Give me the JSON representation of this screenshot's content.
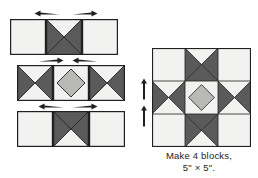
{
  "diagram": {
    "kind": "quilt-block-assembly",
    "block_name": "ohio-star",
    "caption": {
      "line1": "Make 4 blocks,",
      "line2": "5\" × 5\"."
    },
    "colors": {
      "light": "#f2f2f0",
      "medium": "#b9b9b7",
      "dark": "#5a5a5a",
      "outline": "#231f20",
      "arrow": "#231f20",
      "background": "#ffffff",
      "text": "#1b1b1b"
    },
    "rows": [
      {
        "id": "row-top",
        "label": "top-row",
        "cells": [
          {
            "name": "light-square-top-left",
            "type": "plain",
            "fill": "light"
          },
          {
            "name": "hourglass-top-center",
            "type": "hourglass",
            "top": "light",
            "right": "dark",
            "bottom": "dark",
            "left": "dark"
          },
          {
            "name": "light-square-top-right",
            "type": "plain",
            "fill": "light"
          }
        ],
        "arrows": [
          {
            "name": "press-arrow-top-left",
            "direction": "left"
          },
          {
            "name": "press-arrow-top-right",
            "direction": "right"
          }
        ]
      },
      {
        "id": "row-middle",
        "label": "middle-row",
        "cells": [
          {
            "name": "hourglass-middle-left",
            "type": "hourglass",
            "top": "light",
            "right": "dark",
            "bottom": "light",
            "left": "dark"
          },
          {
            "name": "square-in-square-center",
            "type": "square-in-square",
            "field": "light",
            "diamond": "medium"
          },
          {
            "name": "hourglass-middle-right",
            "type": "hourglass",
            "top": "light",
            "right": "dark",
            "bottom": "light",
            "left": "dark"
          }
        ],
        "arrows": [
          {
            "name": "press-arrow-middle-left",
            "direction": "right"
          },
          {
            "name": "press-arrow-middle-right",
            "direction": "left"
          }
        ]
      },
      {
        "id": "row-bottom",
        "label": "bottom-row",
        "cells": [
          {
            "name": "light-square-bottom-left",
            "type": "plain",
            "fill": "light"
          },
          {
            "name": "hourglass-bottom-center",
            "type": "hourglass",
            "top": "dark",
            "right": "dark",
            "bottom": "light",
            "left": "dark"
          },
          {
            "name": "light-square-bottom-right",
            "type": "plain",
            "fill": "light"
          }
        ],
        "arrows": [
          {
            "name": "press-arrow-bottom-left",
            "direction": "left"
          },
          {
            "name": "press-arrow-bottom-right",
            "direction": "right"
          }
        ]
      }
    ],
    "finished_block": {
      "name": "finished-ohio-star-block",
      "grid": [
        [
          {
            "name": "block-cell-r1c1",
            "type": "plain",
            "fill": "light"
          },
          {
            "name": "block-cell-r1c2",
            "type": "hourglass",
            "top": "light",
            "right": "dark",
            "bottom": "dark",
            "left": "dark"
          },
          {
            "name": "block-cell-r1c3",
            "type": "plain",
            "fill": "light"
          }
        ],
        [
          {
            "name": "block-cell-r2c1",
            "type": "hourglass",
            "top": "light",
            "right": "dark",
            "bottom": "light",
            "left": "dark"
          },
          {
            "name": "block-cell-r2c2",
            "type": "square-in-square",
            "field": "light",
            "diamond": "medium"
          },
          {
            "name": "block-cell-r2c3",
            "type": "hourglass",
            "top": "light",
            "right": "dark",
            "bottom": "light",
            "left": "dark"
          }
        ],
        [
          {
            "name": "block-cell-r3c1",
            "type": "plain",
            "fill": "light"
          },
          {
            "name": "block-cell-r3c2",
            "type": "hourglass",
            "top": "dark",
            "right": "dark",
            "bottom": "light",
            "left": "dark"
          },
          {
            "name": "block-cell-r3c3",
            "type": "plain",
            "fill": "light"
          }
        ]
      ],
      "arrows": [
        {
          "name": "press-arrow-block-upper",
          "direction": "up"
        },
        {
          "name": "press-arrow-block-lower",
          "direction": "up"
        }
      ]
    }
  }
}
